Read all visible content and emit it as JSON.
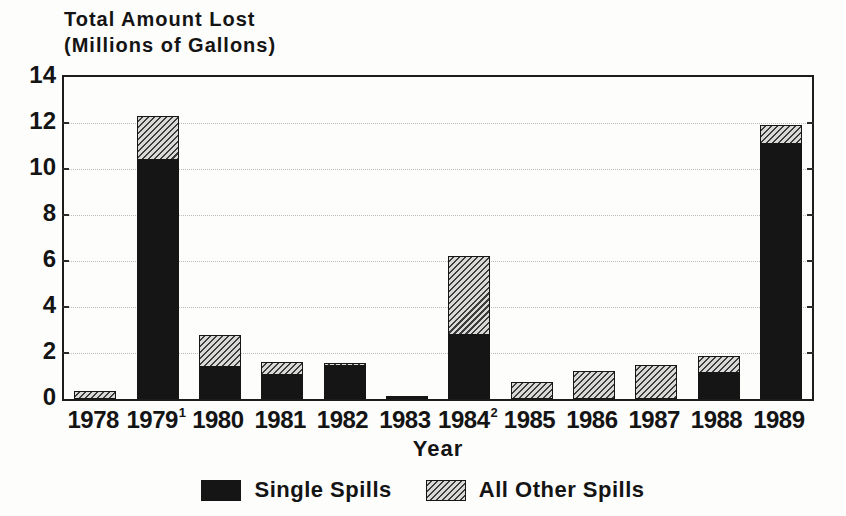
{
  "header": {
    "title_line1": "Total Amount Lost",
    "title_line2": "(Millions of Gallons)"
  },
  "axis": {
    "x_title": "Year"
  },
  "colors": {
    "single_spills": "#151515",
    "other_spills_bg": "#d9d9d7",
    "other_spills_hatch": "#3c3c3c",
    "frame": "#1c1c1c",
    "background": "#fdfdfc"
  },
  "chart_data": {
    "type": "bar",
    "stacked": true,
    "title": "Total Amount Lost (Millions of Gallons)",
    "xlabel": "Year",
    "ylabel": "",
    "ylim": [
      0,
      14
    ],
    "yticks": [
      0,
      2,
      4,
      6,
      8,
      10,
      12,
      14
    ],
    "grid": "horizontal-dotted",
    "legend_position": "bottom",
    "categories": [
      "1978",
      "1979",
      "1980",
      "1981",
      "1982",
      "1983",
      "1984",
      "1985",
      "1986",
      "1987",
      "1988",
      "1989"
    ],
    "category_superscripts": [
      "",
      "1",
      "",
      "",
      "",
      "",
      "2",
      "",
      "",
      "",
      "",
      ""
    ],
    "series": [
      {
        "name": "Single Spills",
        "style": "solid-black",
        "values": [
          0,
          10.4,
          1.4,
          1.05,
          1.45,
          0.05,
          2.8,
          0,
          0,
          0,
          1.15,
          11.1
        ]
      },
      {
        "name": "All Other Spills",
        "style": "diagonal-hatch",
        "values": [
          0.35,
          1.9,
          1.4,
          0.55,
          0.1,
          0.1,
          3.4,
          0.75,
          1.2,
          1.5,
          0.7,
          0.8
        ]
      }
    ],
    "totals": [
      0.35,
      12.3,
      2.8,
      1.6,
      1.55,
      0.15,
      6.2,
      0.75,
      1.2,
      1.5,
      1.85,
      11.9
    ]
  }
}
